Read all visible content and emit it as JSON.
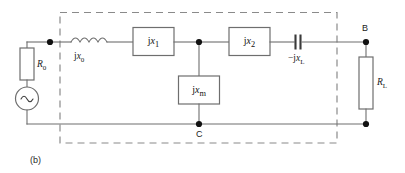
{
  "figure": {
    "caption": "(b)",
    "type": "electrical-circuit-schematic"
  },
  "nodes": [
    {
      "id": "B",
      "label": "B"
    },
    {
      "id": "C",
      "label": "C"
    }
  ],
  "components": [
    {
      "id": "source-resistance",
      "kind": "resistor",
      "symbol": "rectangle-vertical",
      "label_main": "R",
      "label_sub": "0",
      "label_text": "R0"
    },
    {
      "id": "ac-source",
      "kind": "ac-voltage-source",
      "symbol": "circle-with-sine",
      "glyph": "~",
      "label_text": ""
    },
    {
      "id": "series-reactance-0",
      "kind": "inductor",
      "symbol": "coil",
      "label_prefix": "j",
      "label_main": "x",
      "label_sub": "0",
      "label_text": "jx0"
    },
    {
      "id": "series-reactance-1",
      "kind": "reactance-box",
      "symbol": "rectangle",
      "label_prefix": "j",
      "label_main": "x",
      "label_sub": "1",
      "label_text": "jx1"
    },
    {
      "id": "shunt-magnetizing-reactance",
      "kind": "reactance-box",
      "symbol": "rectangle",
      "label_prefix": "j",
      "label_main": "x",
      "label_sub": "m",
      "label_text": "jxm"
    },
    {
      "id": "series-reactance-2",
      "kind": "reactance-box",
      "symbol": "rectangle",
      "label_prefix": "j",
      "label_main": "x",
      "label_sub": "2",
      "label_text": "jx2"
    },
    {
      "id": "series-capacitive-reactance",
      "kind": "capacitor",
      "symbol": "parallel-plates",
      "label_prefix": "−j",
      "label_main": "x",
      "label_sub": "L",
      "label_text": "-jxL"
    },
    {
      "id": "load-resistance",
      "kind": "resistor",
      "symbol": "rectangle-vertical",
      "label_main": "R",
      "label_sub": "L",
      "label_text": "RL"
    }
  ],
  "enclosure": {
    "style": "dashed-rectangle",
    "meaning": "two-port-network-boundary"
  },
  "colors": {
    "wire": "#6e6e6e",
    "dashed_box": "#8a8a8a",
    "node_dot": "#111111",
    "text": "#1a1a1a",
    "background": "#ffffff"
  }
}
